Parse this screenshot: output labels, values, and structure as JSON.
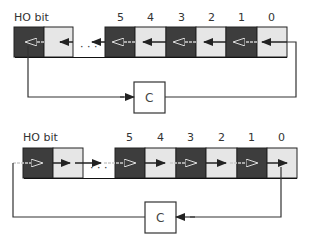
{
  "colors": {
    "dark_bit": "#3d3d3d",
    "light_bit": "#e6e6e6",
    "line": "#333333",
    "box_border": "#2a2a2a",
    "dash": "#b0b0b0"
  },
  "diagrams": [
    {
      "name": "rotate-left-through-carry",
      "ho_label": "HO bit",
      "bit_labels": [
        "5",
        "4",
        "3",
        "2",
        "1",
        "0"
      ],
      "ellipsis": "· · ·",
      "carry_label": "C",
      "direction": "left"
    },
    {
      "name": "rotate-right-through-carry",
      "ho_label": "HO bit",
      "bit_labels": [
        "5",
        "4",
        "3",
        "2",
        "1",
        "0"
      ],
      "ellipsis": "· · ·",
      "carry_label": "C",
      "direction": "right"
    }
  ]
}
